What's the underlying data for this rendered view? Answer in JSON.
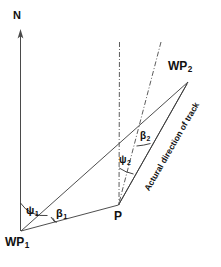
{
  "figure": {
    "type": "navigation-geometry-diagram"
  },
  "labels": {
    "north_axis": "N",
    "waypoint1": "WP",
    "waypoint1_sub": "1",
    "waypoint2": "WP",
    "waypoint2_sub": "2",
    "position": "P",
    "psi1": "ψ",
    "psi1_sub": "1",
    "beta1": "β",
    "beta1_sub": "1",
    "psi2": "ψ",
    "psi2_sub": "2",
    "beta2": "β",
    "beta2_sub": "2",
    "track_annotation": "Actural direction of track"
  },
  "geometry": {
    "north_axis": {
      "x": 20,
      "y_top": 32,
      "y_bottom": 231
    },
    "waypoint1_point": {
      "x": 21,
      "y": 231
    },
    "waypoint2_point": {
      "x": 188,
      "y": 82
    },
    "position_point": {
      "x": 118,
      "y": 205
    },
    "vertical_reference_line": {
      "x": 119,
      "y_top": 42,
      "y_bottom": 205
    },
    "track_reference_line": {
      "x_top": 161,
      "y_top": 42,
      "x_bottom": 118,
      "y_bottom": 205
    }
  },
  "colors": {
    "line": "#3a3a3a",
    "axis": "#4a4a4a",
    "text": "#111111",
    "background": "#ffffff"
  }
}
